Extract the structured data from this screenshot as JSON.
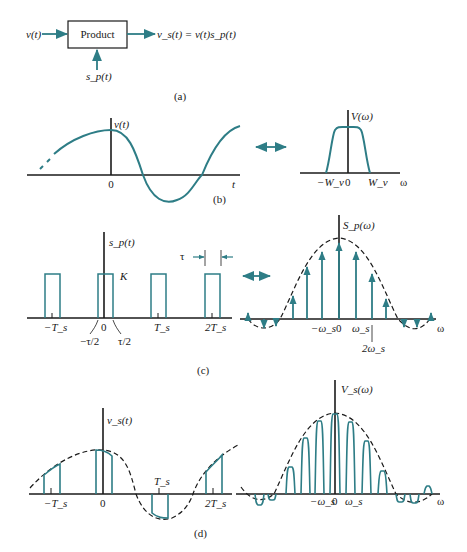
{
  "panel_a": {
    "block_label": "Product",
    "input_label": "v(t)",
    "sampling_label": "s_p(t)",
    "output_label": "v_s(t) = v(t)s_p(t)",
    "caption": "(a)"
  },
  "panel_b": {
    "time_ylabel": "v(t)",
    "time_origin": "0",
    "time_xlabel": "t",
    "freq_ylabel": "V(ω)",
    "freq_ticks": [
      "−W_v",
      "0",
      "W_v"
    ],
    "freq_xlabel": "ω",
    "caption": "(b)"
  },
  "panel_c": {
    "time_ylabel": "s_p(t)",
    "amplitude_label": "K",
    "width_label": "τ",
    "time_ticks": [
      "−T_s",
      "0",
      "T_s",
      "2T_s"
    ],
    "pulse_edge_left": "−τ/2",
    "pulse_edge_right": "τ/2",
    "freq_ylabel": "S_p(ω)",
    "freq_ticks": [
      "−ω_s",
      "0",
      "ω_s"
    ],
    "freq_marker": "2ω_s",
    "freq_xlabel": "ω",
    "caption": "(c)"
  },
  "panel_d": {
    "time_ylabel": "v_s(t)",
    "time_ticks": [
      "−T_s",
      "0",
      "T_s",
      "2T_s"
    ],
    "freq_ylabel": "V_s(ω)",
    "freq_ticks": [
      "−ω_s",
      "0",
      "ω_s"
    ],
    "freq_xlabel": "ω",
    "caption": "(d)"
  },
  "colors": {
    "signal": "#2e7d86",
    "axis": "#1a1a1a"
  }
}
